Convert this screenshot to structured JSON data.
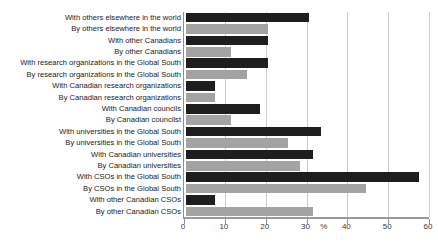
{
  "chart_data": {
    "type": "bar",
    "orientation": "horizontal",
    "title": "",
    "xlabel": "%",
    "ylabel": "",
    "xlim": [
      0,
      60
    ],
    "xticks": [
      0,
      10,
      20,
      30,
      40,
      50,
      60
    ],
    "grid": true,
    "legend": "none",
    "series_colors": {
      "with": "#1e1e1e",
      "by": "#a3a3a3"
    },
    "bars": [
      {
        "label": "With others elsewhere in the world",
        "value": 30,
        "series": "with"
      },
      {
        "label": "By others elsewhere in the world",
        "value": 20,
        "series": "by"
      },
      {
        "label": "With other Canadians",
        "value": 20,
        "series": "with"
      },
      {
        "label": "By other Canadians",
        "value": 11,
        "series": "by"
      },
      {
        "label": "With research organizations in the Global South",
        "value": 20,
        "series": "with"
      },
      {
        "label": "By research organizations in the Global South",
        "value": 15,
        "series": "by"
      },
      {
        "label": "With Canadian research organizations",
        "value": 7,
        "series": "with"
      },
      {
        "label": "By Canadian research organizations",
        "value": 7,
        "series": "by"
      },
      {
        "label": "With Canadian councils",
        "value": 18,
        "series": "with"
      },
      {
        "label": "By Canadian councilst",
        "value": 11,
        "series": "by"
      },
      {
        "label": "With universities in the Global South",
        "value": 33,
        "series": "with"
      },
      {
        "label": "By universities in the Global South",
        "value": 25,
        "series": "by"
      },
      {
        "label": "With Canadian universities",
        "value": 31,
        "series": "with"
      },
      {
        "label": "By Canadian universities",
        "value": 28,
        "series": "by"
      },
      {
        "label": "With CSOs in the Global South",
        "value": 57,
        "series": "with"
      },
      {
        "label": "By CSOs in the Global South",
        "value": 44,
        "series": "by"
      },
      {
        "label": "With other Canadian CSOs",
        "value": 7,
        "series": "with"
      },
      {
        "label": "By other Canadian CSOs",
        "value": 31,
        "series": "by"
      }
    ],
    "xlabel_position_value": 34.5
  }
}
